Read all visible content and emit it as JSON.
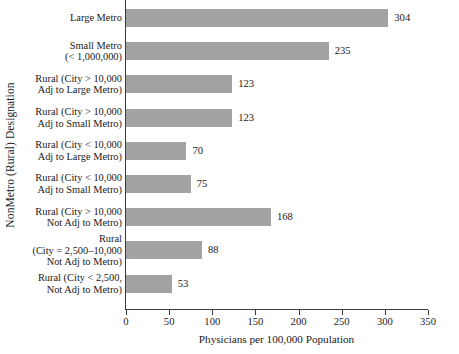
{
  "chart_data": {
    "type": "bar",
    "orientation": "horizontal",
    "title": "",
    "xlabel": "Physicians per 100,000 Population",
    "ylabel": "NonMetro (Rural) Designation",
    "xlim": [
      0,
      350
    ],
    "xticks": [
      0,
      50,
      100,
      150,
      200,
      250,
      300,
      350
    ],
    "xtick_labels": [
      "0",
      "50",
      "100",
      "150",
      "200",
      "250",
      "300",
      "350"
    ],
    "grid": false,
    "legend": null,
    "bar_color": "#a3a3a3",
    "axis_color": "#3a3a3a",
    "categories": [
      "Large Metro",
      "Small Metro (< 1,000,000)",
      "Rural (City > 10,000 Adj to Large Metro)",
      "Rural (City > 10,000 Adj to Small Metro)",
      "Rural (City < 10,000 Adj to Large Metro)",
      "Rural (City < 10,000 Adj to Small Metro)",
      "Rural (City > 10,000 Not Adj to Metro)",
      "Rural (City = 2,500–10,000 Not Adj to Metro)",
      "Rural (City < 2,500, Not Adj to Metro)"
    ],
    "category_label_lines": [
      [
        "Large Metro"
      ],
      [
        "Small Metro",
        "(< 1,000,000)"
      ],
      [
        "Rural (City > 10,000",
        "Adj to Large Metro)"
      ],
      [
        "Rural (City > 10,000",
        "Adj to Small Metro)"
      ],
      [
        "Rural (City < 10,000",
        "Adj to Large Metro)"
      ],
      [
        "Rural (City < 10,000",
        "Adj to Small Metro)"
      ],
      [
        "Rural (City > 10,000",
        "Not Adj to Metro)"
      ],
      [
        "Rural",
        "(City = 2,500–10,000",
        "Not Adj to Metro)"
      ],
      [
        "Rural (City < 2,500,",
        "Not Adj to Metro)"
      ]
    ],
    "values": [
      304,
      235,
      123,
      123,
      70,
      75,
      168,
      88,
      53
    ],
    "value_labels": [
      "304",
      "235",
      "123",
      "123",
      "70",
      "75",
      "168",
      "88",
      "53"
    ]
  }
}
